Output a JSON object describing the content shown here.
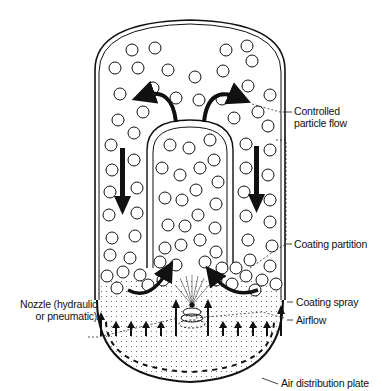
{
  "diagram": {
    "type": "Wurster fluid-bed coating chamber",
    "labels": {
      "controlled_particle_flow": [
        "Controlled",
        "particle flow"
      ],
      "coating_partition": "Coating partition",
      "coating_spray": "Coating spray",
      "airflow": "Airflow",
      "nozzle": [
        "Nozzle (hydraulic",
        "or pneumatic)"
      ],
      "air_distribution_plate": "Air distribution plate"
    },
    "colors": {
      "line": "#111111",
      "background": "#ffffff"
    }
  }
}
